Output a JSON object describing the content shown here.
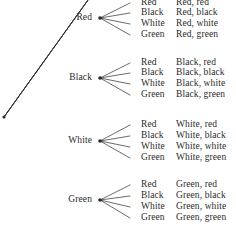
{
  "diagram": {
    "type": "probability-tree-diagram",
    "root": {
      "x": 4,
      "y": 117
    },
    "colors": {
      "line": "#2b2b2b",
      "text": "#2b2b2b",
      "background": "#ffffff"
    },
    "level1": [
      {
        "label": "Red",
        "label_x": 92,
        "label_y": 18,
        "vertex_x": 100,
        "vertex_y": 18
      },
      {
        "label": "Black",
        "label_x": 92,
        "label_y": 78,
        "vertex_x": 100,
        "vertex_y": 78
      },
      {
        "label": "White",
        "label_x": 92,
        "label_y": 141,
        "vertex_x": 100,
        "vertex_y": 141
      },
      {
        "label": "Green",
        "label_x": 92,
        "label_y": 200,
        "vertex_x": 100,
        "vertex_y": 200
      }
    ],
    "branches": [
      {
        "parent": "Red",
        "children": [
          {
            "label": "Red",
            "outcome": "Red, red",
            "y": 3
          },
          {
            "label": "Black",
            "outcome": "Red, black",
            "y": 13
          },
          {
            "label": "White",
            "outcome": "Red, white",
            "y": 24
          },
          {
            "label": "Green",
            "outcome": "Red, green",
            "y": 35
          }
        ]
      },
      {
        "parent": "Black",
        "children": [
          {
            "label": "Red",
            "outcome": "Black, red",
            "y": 63
          },
          {
            "label": "Black",
            "outcome": "Black, black",
            "y": 73
          },
          {
            "label": "White",
            "outcome": "Black, white",
            "y": 84
          },
          {
            "label": "Green",
            "outcome": "Black, green",
            "y": 95
          }
        ]
      },
      {
        "parent": "White",
        "children": [
          {
            "label": "Red",
            "outcome": "White, red",
            "y": 125
          },
          {
            "label": "Black",
            "outcome": "White, black",
            "y": 136
          },
          {
            "label": "White",
            "outcome": "White, white",
            "y": 147
          },
          {
            "label": "Green",
            "outcome": "White, green",
            "y": 158
          }
        ]
      },
      {
        "parent": "Green",
        "children": [
          {
            "label": "Red",
            "outcome": "Green, red",
            "y": 185
          },
          {
            "label": "Black",
            "outcome": "Green, black",
            "y": 196
          },
          {
            "label": "White",
            "outcome": "Green, white",
            "y": 207
          },
          {
            "label": "Green",
            "outcome": "Green, green",
            "y": 218
          }
        ]
      }
    ],
    "layout": {
      "level2_label_x": 141,
      "outcome_label_x": 176,
      "branch_start_x": 130,
      "level1_line_end_x": 88
    }
  }
}
